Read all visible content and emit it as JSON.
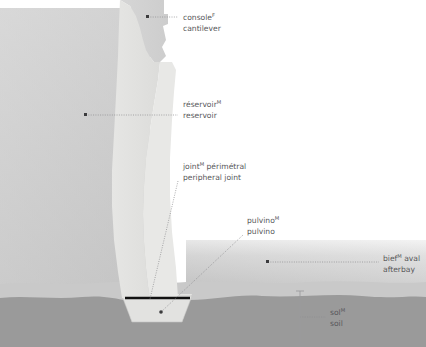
{
  "figure": {
    "kind": "technical-cross-section",
    "languages": [
      "fr",
      "sup-F",
      "en"
    ],
    "background": "#ffffff"
  },
  "palette": {
    "reservoir_top": "#d8d8d8",
    "reservoir_bottom": "#c4c4c4",
    "dam_concrete": "#e2e2e0",
    "dam_crest": "#d2d2d2",
    "afterbay_top": "#fdfdfd",
    "afterbay_bottom": "#bdbdbd",
    "soil_upper": "#c9c9c9",
    "soil_lower": "#9a9a9a",
    "joint_line": "#111111",
    "label_text": "#58585a",
    "leader_line": "#8d8d90"
  },
  "labels": [
    {
      "id": "console",
      "fr": "console",
      "sup": "F",
      "en": "cantilever",
      "text_x": 183,
      "fr_y": 17,
      "en_y": 28,
      "anchor": {
        "x": 148,
        "y": 17
      },
      "leader": {
        "type": "dotted-horizontal",
        "from_x": 148,
        "to_x": 178,
        "y": 17
      }
    },
    {
      "id": "reservoir",
      "fr": "réservoir",
      "sup": "M",
      "en": "reservoir",
      "text_x": 183,
      "fr_y": 104,
      "en_y": 115,
      "anchor": {
        "x": 86,
        "y": 115
      },
      "leader": {
        "type": "dotted-horizontal",
        "from_x": 86,
        "to_x": 178,
        "y": 115
      }
    },
    {
      "id": "joint",
      "fr": "joint",
      "sup": "M",
      "fr_tail": " périmétral",
      "en": "peripheral joint",
      "text_x": 183,
      "fr_y": 166,
      "en_y": 177,
      "anchor": {
        "x": 150,
        "y": 299
      },
      "leader": {
        "type": "dotted-diagonal",
        "x1": 178,
        "y1": 181,
        "x2": 150,
        "y2": 299
      }
    },
    {
      "id": "pulvino",
      "fr": "pulvino",
      "sup": "M",
      "en": "pulvino",
      "text_x": 247,
      "fr_y": 220,
      "en_y": 231,
      "anchor": {
        "x": 161,
        "y": 312
      },
      "leader": {
        "type": "dotted-diagonal",
        "x1": 243,
        "y1": 235,
        "x2": 161,
        "y2": 312
      }
    },
    {
      "id": "afterbay",
      "fr": "bief",
      "sup": "M",
      "fr_tail": " aval",
      "en": "afterbay",
      "text_x": 383,
      "fr_y": 258,
      "en_y": 269,
      "anchor": {
        "x": 268,
        "y": 262
      },
      "leader": {
        "type": "dotted-horizontal",
        "from_x": 268,
        "to_x": 379,
        "y": 262
      }
    },
    {
      "id": "soil",
      "fr": "sol",
      "sup": "M",
      "en": "soil",
      "text_x": 330,
      "fr_y": 312,
      "en_y": 323,
      "anchor": {
        "x": 300,
        "y": 317
      },
      "leader": {
        "type": "dotted-horizontal",
        "from_x": 300,
        "to_x": 326,
        "y": 317
      },
      "bracket": {
        "x": 300,
        "y_top": 291,
        "y_bottom": 344,
        "cap_width": 7
      }
    }
  ],
  "geometry": {
    "reservoir_region": {
      "x": 0,
      "y": 8,
      "width": 150,
      "height": 285
    },
    "afterbay_region": {
      "x": 190,
      "y": 240,
      "width": 236,
      "height": 52
    },
    "soil_upper_band": {
      "y": 282,
      "height": 13
    },
    "soil_lower_band": {
      "y": 295,
      "height": 52
    },
    "joint_line": {
      "x1": 125,
      "x2": 190,
      "y": 298,
      "thickness": 2.6
    },
    "pulvino_block": {
      "top_y": 294,
      "bottom_y": 322,
      "top_x1": 122,
      "top_x2": 192,
      "bottom_x1": 132,
      "bottom_x2": 182
    },
    "dam_crest": {
      "x1": 120,
      "x2": 165,
      "y": 0
    },
    "dam_base": {
      "x1": 122,
      "x2": 175,
      "y": 298
    }
  }
}
